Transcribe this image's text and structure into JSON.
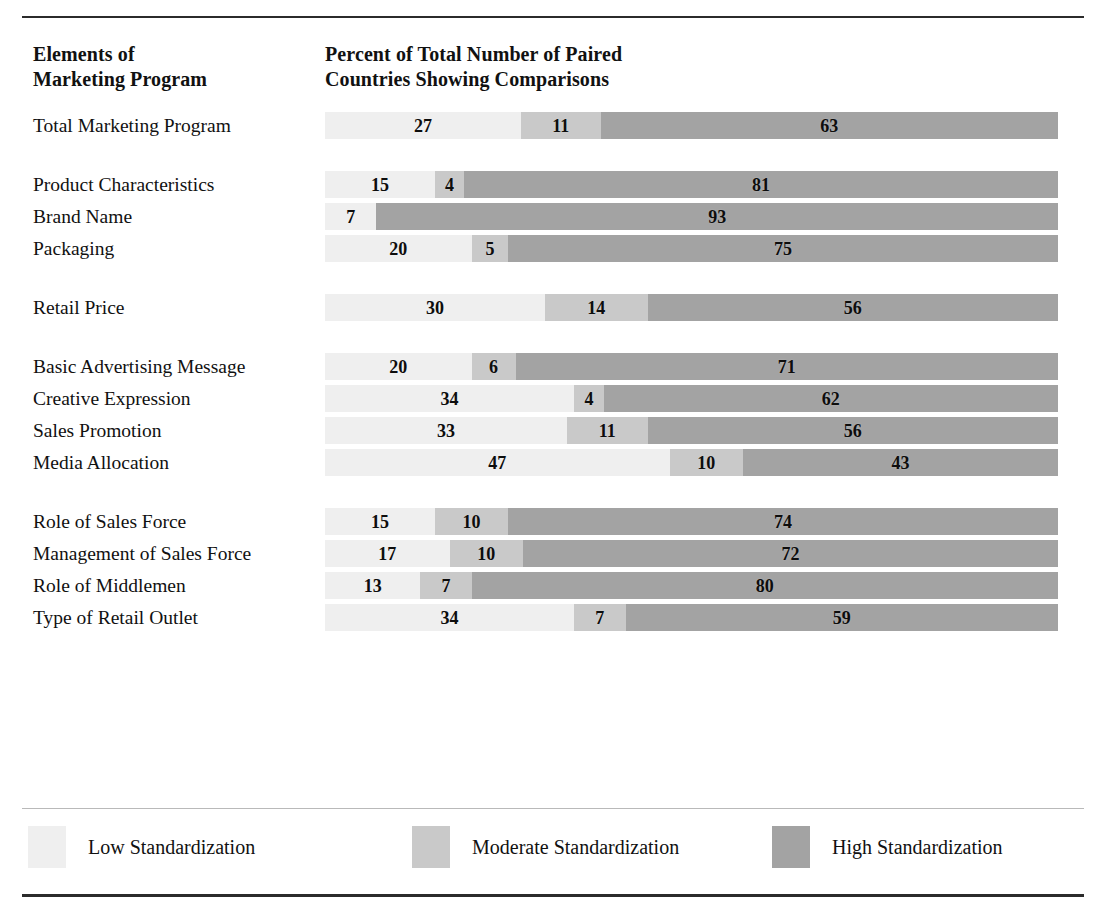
{
  "header": {
    "left_line1": "Elements of",
    "left_line2": "Marketing Program",
    "right_line1": "Percent of Total Number of Paired",
    "right_line2": "Countries Showing Comparisons"
  },
  "legend": {
    "low": {
      "label": "Low Standardization",
      "color": "#efefef"
    },
    "moderate": {
      "label": "Moderate Standardization",
      "color": "#c9c9c9"
    },
    "high": {
      "label": "High Standardization",
      "color": "#a3a3a3"
    }
  },
  "chart_data": {
    "type": "bar",
    "orientation": "horizontal",
    "stacked": true,
    "title": "Percent of Total Number of Paired Countries Showing Comparisons",
    "xlabel": "",
    "ylabel": "Elements of Marketing Program",
    "xlim": [
      0,
      100
    ],
    "grid": false,
    "legend_position": "bottom",
    "categories": [
      "Total Marketing Program",
      "Product Characteristics",
      "Brand Name",
      "Packaging",
      "Retail Price",
      "Basic Advertising Message",
      "Creative Expression",
      "Sales Promotion",
      "Media Allocation",
      "Role of Sales Force",
      "Management of Sales Force",
      "Role of Middlemen",
      "Type of Retail Outlet"
    ],
    "series": [
      {
        "name": "Low Standardization",
        "values": [
          27,
          15,
          7,
          20,
          30,
          20,
          34,
          33,
          47,
          15,
          17,
          13,
          34
        ]
      },
      {
        "name": "Moderate Standardization",
        "values": [
          11,
          4,
          0,
          5,
          14,
          6,
          4,
          11,
          10,
          10,
          10,
          7,
          7
        ]
      },
      {
        "name": "High Standardization",
        "values": [
          63,
          81,
          93,
          75,
          56,
          71,
          62,
          56,
          43,
          74,
          72,
          80,
          59
        ]
      }
    ]
  },
  "rows": [
    {
      "label": "Total Marketing Program",
      "low": 27,
      "moderate": 11,
      "high": 63,
      "low_text": "27",
      "moderate_text": "11",
      "high_text": "63",
      "group_end": true
    },
    {
      "label": "Product Characteristics",
      "low": 15,
      "moderate": 4,
      "high": 81,
      "low_text": "15",
      "moderate_text": "4",
      "high_text": "81",
      "group_end": false
    },
    {
      "label": "Brand Name",
      "low": 7,
      "moderate": 0,
      "high": 93,
      "low_text": "7",
      "moderate_text": "",
      "high_text": "93",
      "group_end": false
    },
    {
      "label": "Packaging",
      "low": 20,
      "moderate": 5,
      "high": 75,
      "low_text": "20",
      "moderate_text": "5",
      "high_text": "75",
      "group_end": true
    },
    {
      "label": "Retail Price",
      "low": 30,
      "moderate": 14,
      "high": 56,
      "low_text": "30",
      "moderate_text": "14",
      "high_text": "56",
      "group_end": true
    },
    {
      "label": "Basic Advertising Message",
      "low": 20,
      "moderate": 6,
      "high": 74,
      "low_text": "20",
      "moderate_text": "6",
      "high_text": "71",
      "group_end": false
    },
    {
      "label": "Creative Expression",
      "low": 34,
      "moderate": 4,
      "high": 62,
      "low_text": "34",
      "moderate_text": "4",
      "high_text": "62",
      "group_end": false
    },
    {
      "label": "Sales Promotion",
      "low": 33,
      "moderate": 11,
      "high": 56,
      "low_text": "33",
      "moderate_text": "11",
      "high_text": "56",
      "group_end": false
    },
    {
      "label": "Media Allocation",
      "low": 47,
      "moderate": 10,
      "high": 43,
      "low_text": "47",
      "moderate_text": "10",
      "high_text": "43",
      "group_end": true
    },
    {
      "label": "Role of Sales Force",
      "low": 15,
      "moderate": 10,
      "high": 75,
      "low_text": "15",
      "moderate_text": "10",
      "high_text": "74",
      "group_end": false
    },
    {
      "label": "Management of Sales Force",
      "low": 17,
      "moderate": 10,
      "high": 73,
      "low_text": "17",
      "moderate_text": "10",
      "high_text": "72",
      "group_end": false
    },
    {
      "label": "Role of Middlemen",
      "low": 13,
      "moderate": 7,
      "high": 80,
      "low_text": "13",
      "moderate_text": "7",
      "high_text": "80",
      "group_end": false
    },
    {
      "label": "Type of Retail Outlet",
      "low": 34,
      "moderate": 7,
      "high": 59,
      "low_text": "34",
      "moderate_text": "7",
      "high_text": "59",
      "group_end": false
    }
  ]
}
